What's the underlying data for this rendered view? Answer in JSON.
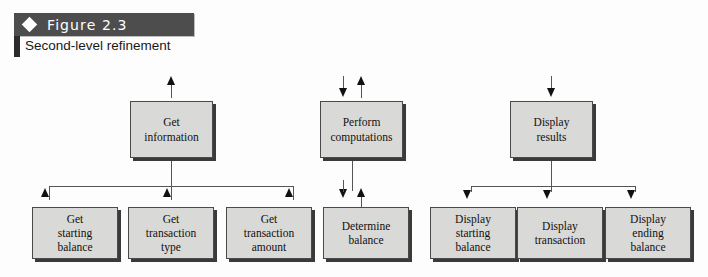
{
  "figure": {
    "diamond_icon": "diamond-icon",
    "label": "Figure 2.3",
    "caption": "Second-level refinement",
    "banner_color": "#4d4d4d",
    "banner_text_color": "#ffffff"
  },
  "diagram": {
    "type": "hierarchy-refinement-chart",
    "box_fill": "#d9d9d7",
    "box_border": "#4a4a4a",
    "shadow_color": "#3a3a3a",
    "line_color": "#555555",
    "arrow_color": "#111111",
    "top_level": [
      {
        "id": "get-information",
        "line1": "Get",
        "line2": "information",
        "inbound_arrows": [
          "up"
        ],
        "outbound_arrows": [
          "up",
          "up",
          "up"
        ]
      },
      {
        "id": "perform-computations",
        "line1": "Perform",
        "line2": "computations",
        "inbound_arrows": [
          "down",
          "up"
        ],
        "outbound_arrows": [
          "down",
          "up"
        ]
      },
      {
        "id": "display-results",
        "line1": "Display",
        "line2": "results",
        "inbound_arrows": [
          "down"
        ],
        "outbound_arrows": [
          "down",
          "down",
          "down"
        ]
      }
    ],
    "second_level": [
      {
        "id": "get-starting-balance",
        "line1": "Get",
        "line2": "starting",
        "line3": "balance",
        "arrow": "up",
        "parent": "get-information"
      },
      {
        "id": "get-transaction-type",
        "line1": "Get",
        "line2": "transaction",
        "line3": "type",
        "arrow": "up",
        "parent": "get-information"
      },
      {
        "id": "get-transaction-amount",
        "line1": "Get",
        "line2": "transaction",
        "line3": "amount",
        "arrow": "up",
        "parent": "get-information"
      },
      {
        "id": "determine-balance",
        "line1": "Determine",
        "line2": "balance",
        "line3": "",
        "arrow": "down-up",
        "parent": "perform-computations"
      },
      {
        "id": "display-starting-balance",
        "line1": "Display",
        "line2": "starting",
        "line3": "balance",
        "arrow": "down",
        "parent": "display-results"
      },
      {
        "id": "display-transaction",
        "line1": "Display",
        "line2": "transaction",
        "line3": "",
        "arrow": "down",
        "parent": "display-results"
      },
      {
        "id": "display-ending-balance",
        "line1": "Display",
        "line2": "ending",
        "line3": "balance",
        "arrow": "down",
        "parent": "display-results"
      }
    ]
  }
}
